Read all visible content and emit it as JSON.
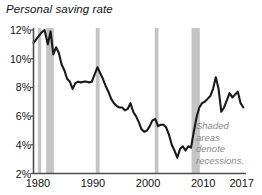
{
  "chart_data": {
    "type": "line",
    "title": "Personal saving rate",
    "xlabel": "",
    "ylabel": "",
    "ylim": [
      2,
      12
    ],
    "xlim": [
      1979.2,
      2017.6
    ],
    "grid": false,
    "legend_position": "none",
    "y_tick_labels": [
      "2%",
      "4%",
      "6%",
      "8%",
      "10%",
      "12%"
    ],
    "y_tick_values": [
      2,
      4,
      6,
      8,
      10,
      12
    ],
    "x_tick_labels": [
      "1980",
      "1990",
      "2000",
      "2010",
      "2017"
    ],
    "x_tick_values": [
      1980,
      1990,
      2000,
      2010,
      2017
    ],
    "series": [
      {
        "name": "Personal saving rate",
        "color": "#1a1a1a",
        "x": [
          1979.2,
          1980.0,
          1980.6,
          1981.2,
          1981.8,
          1982.3,
          1982.8,
          1983.3,
          1983.8,
          1984.3,
          1984.8,
          1985.3,
          1985.8,
          1986.3,
          1986.8,
          1987.3,
          1987.8,
          1988.3,
          1988.8,
          1989.3,
          1989.8,
          1990.3,
          1990.8,
          1991.3,
          1991.8,
          1992.3,
          1992.8,
          1993.3,
          1993.8,
          1994.3,
          1994.8,
          1995.3,
          1995.8,
          1996.3,
          1996.8,
          1997.3,
          1997.8,
          1998.3,
          1998.8,
          1999.3,
          1999.8,
          2000.3,
          2000.8,
          2001.3,
          2001.8,
          2002.3,
          2002.8,
          2003.3,
          2003.8,
          2004.3,
          2004.8,
          2005.3,
          2005.8,
          2006.3,
          2006.8,
          2007.3,
          2007.8,
          2008.3,
          2008.8,
          2009.3,
          2009.8,
          2010.3,
          2010.8,
          2011.3,
          2011.8,
          2012.3,
          2012.8,
          2013.3,
          2013.8,
          2014.3,
          2014.8,
          2015.3,
          2015.8,
          2016.3,
          2016.8,
          2017.3
        ],
        "y": [
          11.1,
          11.5,
          11.8,
          12.0,
          11.0,
          11.9,
          10.3,
          10.8,
          10.4,
          9.6,
          9.2,
          8.6,
          8.4,
          7.9,
          8.3,
          8.4,
          8.35,
          8.4,
          8.4,
          8.35,
          8.4,
          8.9,
          9.4,
          9.0,
          8.6,
          8.1,
          7.7,
          7.2,
          6.9,
          6.7,
          6.6,
          6.6,
          6.4,
          6.5,
          6.9,
          6.3,
          6.0,
          5.6,
          5.1,
          4.9,
          5.0,
          5.3,
          5.7,
          5.8,
          5.3,
          5.4,
          5.4,
          5.2,
          4.7,
          4.0,
          3.6,
          3.1,
          3.7,
          3.9,
          3.6,
          3.9,
          3.8,
          4.9,
          5.9,
          6.6,
          6.9,
          7.0,
          7.2,
          7.4,
          7.9,
          8.7,
          7.9,
          6.3,
          6.6,
          7.1,
          7.6,
          7.3,
          7.5,
          7.7,
          6.9,
          6.6
        ]
      }
    ],
    "shaded_regions": [
      {
        "label": "recession-1980",
        "start": 1980.0,
        "end": 1980.6
      },
      {
        "label": "recession-1981-1982",
        "start": 1981.5,
        "end": 1982.9
      },
      {
        "label": "recession-1990-1991",
        "start": 1990.5,
        "end": 1991.2
      },
      {
        "label": "recession-2001",
        "start": 2001.2,
        "end": 2001.9
      },
      {
        "label": "recession-2007-2009",
        "start": 2007.9,
        "end": 2009.4
      }
    ],
    "shade_color": "#c4c4c4",
    "annotation": {
      "lines": [
        "Shaded",
        "areas",
        "denote",
        "recessions."
      ],
      "color": "#8a8a8a"
    }
  },
  "axis": {
    "line_color": "#4d4d4d"
  }
}
